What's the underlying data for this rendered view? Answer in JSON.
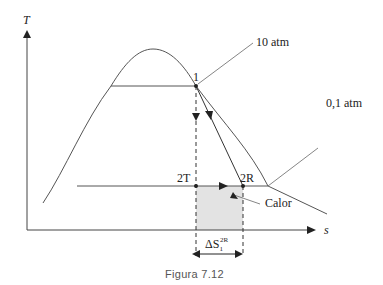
{
  "diagram": {
    "type": "T-s diagram",
    "axes": {
      "y_label": "T",
      "x_label": "s"
    },
    "isobars": [
      {
        "label": "10 atm"
      },
      {
        "label": "0,1 atm"
      }
    ],
    "points": [
      {
        "label": "1"
      },
      {
        "label": "2T"
      },
      {
        "label": "2R"
      }
    ],
    "shaded_area_label": "Calor",
    "delta_label_main": "ΔS",
    "delta_label_sub": "1",
    "delta_label_sup": "2R",
    "colors": {
      "line": "#444444",
      "shade": "#e3e3e3",
      "text": "#222222"
    }
  },
  "caption": "Figura 7.12"
}
